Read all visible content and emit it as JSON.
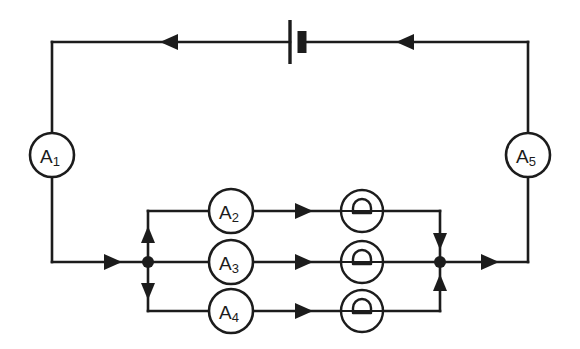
{
  "diagram": {
    "background_color": "#ffffff",
    "line_color": "#1c1c1c"
  },
  "meters": [
    {
      "id": "A1",
      "base": "A",
      "subscript": "1",
      "name": "ammeter-a1",
      "cx": 52,
      "cy": 155,
      "r": 22
    },
    {
      "id": "A2",
      "base": "A",
      "subscript": "2",
      "name": "ammeter-a2",
      "cx": 231,
      "cy": 211,
      "r": 22
    },
    {
      "id": "A3",
      "base": "A",
      "subscript": "3",
      "name": "ammeter-a3",
      "cx": 231,
      "cy": 262,
      "r": 22
    },
    {
      "id": "A4",
      "base": "A",
      "subscript": "4",
      "name": "ammeter-a4",
      "cx": 231,
      "cy": 311,
      "r": 22
    },
    {
      "id": "A5",
      "base": "A",
      "subscript": "5",
      "name": "ammeter-a5",
      "cx": 528,
      "cy": 155,
      "r": 22
    }
  ],
  "resistors": [
    {
      "id": "R1",
      "symbol": "omega",
      "name": "resistor-top",
      "cx": 362,
      "cy": 211,
      "r": 21
    },
    {
      "id": "R2",
      "symbol": "omega",
      "name": "resistor-middle",
      "cx": 362,
      "cy": 262,
      "r": 21
    },
    {
      "id": "R3",
      "symbol": "omega",
      "name": "resistor-bottom",
      "cx": 362,
      "cy": 311,
      "r": 21
    }
  ],
  "battery": {
    "name": "battery-cell",
    "x": 290,
    "y": 42,
    "positive_plate_half_height": 22,
    "negative_plate_half_height": 11,
    "negative_offset": 12
  },
  "current_arrows": [
    {
      "name": "arrow-top-left",
      "direction": "left",
      "x": 172,
      "y": 42
    },
    {
      "name": "arrow-top-right",
      "direction": "left",
      "x": 408,
      "y": 42
    },
    {
      "name": "arrow-bottom-left",
      "direction": "right",
      "x": 110,
      "y": 262
    },
    {
      "name": "arrow-bottom-right",
      "direction": "right",
      "x": 487,
      "y": 262
    },
    {
      "name": "arrow-branch-up-left",
      "direction": "up",
      "x": 148,
      "y": 238
    },
    {
      "name": "arrow-branch-down-left",
      "direction": "down",
      "x": 148,
      "y": 288
    },
    {
      "name": "arrow-branch-down-right",
      "direction": "down",
      "x": 440,
      "y": 238
    },
    {
      "name": "arrow-branch-up-right",
      "direction": "up",
      "x": 440,
      "y": 288
    },
    {
      "name": "arrow-branch-top",
      "direction": "right",
      "x": 301,
      "y": 211
    },
    {
      "name": "arrow-branch-middle",
      "direction": "right",
      "x": 301,
      "y": 262
    },
    {
      "name": "arrow-branch-bottom",
      "direction": "right",
      "x": 301,
      "y": 311
    }
  ],
  "junction_nodes": [
    {
      "name": "junction-left",
      "x": 148,
      "y": 262
    },
    {
      "name": "junction-right",
      "x": 440,
      "y": 262
    }
  ]
}
